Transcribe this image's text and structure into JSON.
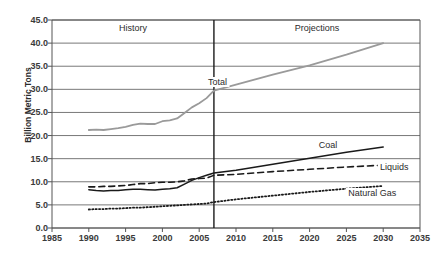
{
  "chart_data": {
    "type": "line",
    "title": "",
    "xlabel": "",
    "ylabel": "Billion Metric Tons",
    "xlim": [
      1985,
      2035
    ],
    "ylim": [
      0.0,
      45.0
    ],
    "xticks": [
      "1985",
      "1990",
      "1995",
      "2000",
      "2005",
      "2010",
      "2015",
      "2020",
      "2025",
      "2030",
      "2035"
    ],
    "yticks": [
      "0.0",
      "5.0",
      "10.0",
      "15.0",
      "20.0",
      "25.0",
      "30.0",
      "35.0",
      "40.0",
      "45.0"
    ],
    "grid": "horizontal",
    "legend_position": "inline-annotations",
    "annotations": [
      {
        "name": "history-label",
        "text": "History",
        "x": 1996,
        "y": 43.2
      },
      {
        "name": "projections-label",
        "text": "Projections",
        "x": 2021,
        "y": 43.2
      },
      {
        "name": "total-label",
        "text": "Total",
        "x": 2007.5,
        "y": 31.5
      },
      {
        "name": "coal-label",
        "text": "Coal",
        "x": 2022.5,
        "y": 18.0
      },
      {
        "name": "liquids-label",
        "text": "Liquids",
        "x": 2031.5,
        "y": 13.2
      },
      {
        "name": "natural-gas-label",
        "text": "Natural Gas",
        "x": 2028.5,
        "y": 7.6
      }
    ],
    "divider": {
      "name": "history-projection-divider",
      "x": 2007
    },
    "series": [
      {
        "name": "Total",
        "style": "solid",
        "color": "#9a9a9a",
        "width": 1.8,
        "x": [
          1990,
          1991,
          1992,
          1993,
          1994,
          1995,
          1996,
          1997,
          1998,
          1999,
          2000,
          2001,
          2002,
          2003,
          2004,
          2005,
          2006,
          2007,
          2010,
          2015,
          2020,
          2025,
          2030
        ],
        "y": [
          21.2,
          21.3,
          21.2,
          21.4,
          21.6,
          21.9,
          22.3,
          22.6,
          22.5,
          22.5,
          23.1,
          23.3,
          23.7,
          24.9,
          26.1,
          27.0,
          28.1,
          29.7,
          31.0,
          33.2,
          35.2,
          37.5,
          40.0
        ]
      },
      {
        "name": "Coal",
        "style": "solid",
        "color": "#1a1a1a",
        "width": 1.5,
        "x": [
          1990,
          1991,
          1992,
          1993,
          1994,
          1995,
          1996,
          1997,
          1998,
          1999,
          2000,
          2001,
          2002,
          2003,
          2004,
          2005,
          2006,
          2007,
          2010,
          2015,
          2020,
          2025,
          2030
        ],
        "y": [
          8.3,
          8.1,
          8.0,
          8.1,
          8.1,
          8.3,
          8.4,
          8.4,
          8.3,
          8.2,
          8.4,
          8.5,
          8.7,
          9.5,
          10.3,
          10.9,
          11.4,
          11.9,
          12.5,
          13.8,
          15.1,
          16.4,
          17.5
        ]
      },
      {
        "name": "Liquids",
        "style": "dashed",
        "color": "#1a1a1a",
        "width": 1.6,
        "x": [
          1990,
          1991,
          1992,
          1993,
          1994,
          1995,
          1996,
          1997,
          1998,
          1999,
          2000,
          2001,
          2002,
          2003,
          2004,
          2005,
          2006,
          2007,
          2010,
          2015,
          2020,
          2025,
          2030
        ],
        "y": [
          8.9,
          8.9,
          9.0,
          9.0,
          9.1,
          9.2,
          9.4,
          9.6,
          9.6,
          9.8,
          9.9,
          9.9,
          10.0,
          10.2,
          10.6,
          10.7,
          10.8,
          11.4,
          11.6,
          12.2,
          12.7,
          13.2,
          13.6
        ]
      },
      {
        "name": "Natural Gas",
        "style": "dotted",
        "color": "#1a1a1a",
        "width": 1.8,
        "x": [
          1990,
          1991,
          1992,
          1993,
          1994,
          1995,
          1996,
          1997,
          1998,
          1999,
          2000,
          2001,
          2002,
          2003,
          2004,
          2005,
          2006,
          2007,
          2010,
          2015,
          2020,
          2025,
          2030
        ],
        "y": [
          4.0,
          4.1,
          4.1,
          4.2,
          4.2,
          4.3,
          4.4,
          4.4,
          4.5,
          4.6,
          4.7,
          4.8,
          4.9,
          5.0,
          5.1,
          5.2,
          5.3,
          5.6,
          6.2,
          7.0,
          7.8,
          8.5,
          9.1
        ]
      }
    ]
  }
}
